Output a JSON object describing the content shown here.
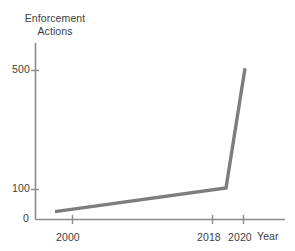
{
  "chart_data": {
    "type": "line",
    "title": "",
    "xlabel": "Year",
    "ylabel": "Enforcement Actions",
    "ylabel_line1": "Enforcement",
    "ylabel_line2": "Actions",
    "x": [
      2000,
      2018,
      2020
    ],
    "values": [
      25,
      100,
      480
    ],
    "series": [
      {
        "name": "Enforcement Actions",
        "values": [
          25,
          100,
          480
        ]
      }
    ],
    "categories": [
      "2000",
      "2018",
      "2020"
    ],
    "xtick_labels": [
      "2000",
      "2018",
      "2020"
    ],
    "ytick_labels": [
      "0",
      "100",
      "500"
    ],
    "ytick_values": [
      0,
      100,
      500
    ],
    "xlim": [
      1996,
      2026
    ],
    "ylim": [
      0,
      560
    ],
    "grid": false,
    "legend": false,
    "legend_position": "none",
    "line_color": "#7d7d7d",
    "axis_color": "#8a8a8a",
    "background_color": "#ffffff",
    "annotations": []
  },
  "axes": {
    "y_title_line1": "Enforcement",
    "y_title_line2": "Actions",
    "x_title": "Year",
    "y_ticks": [
      {
        "label": "500",
        "value": 500
      },
      {
        "label": "100",
        "value": 100
      },
      {
        "label": "0",
        "value": 0
      }
    ],
    "x_ticks": [
      {
        "label": "2000",
        "value": 2000
      },
      {
        "label": "2018",
        "value": 2018
      },
      {
        "label": "2020",
        "value": 2020
      }
    ]
  }
}
